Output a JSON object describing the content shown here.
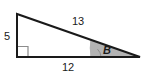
{
  "figure": {
    "kind": "right-triangle-diagram",
    "background_color": "#ffffff",
    "stroke_color": "#1a1a1a",
    "stroke_width": 2,
    "right_angle_marker_color": "#8c8c8c",
    "angle_fill_color": "#b3b3b3",
    "angle_fill_stroke": "#8c8c8c",
    "vertices": {
      "apex": [
        17,
        14
      ],
      "right_angle": [
        17,
        57
      ],
      "angle_b": [
        140,
        57
      ]
    },
    "right_angle_marker": {
      "x": 18,
      "y": 46,
      "size": 10
    },
    "angle_region": {
      "start_x": 90,
      "end_x": 140,
      "baseline_y": 57
    },
    "labels": {
      "leg_vertical": "5",
      "hypotenuse": "13",
      "leg_base": "12",
      "angle": "B"
    }
  }
}
